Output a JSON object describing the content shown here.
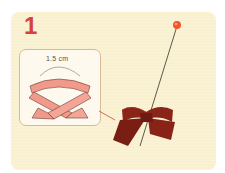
{
  "step": {
    "number": "1"
  },
  "diagram": {
    "measurement_label": "1.5 cm",
    "ribbon_color": "#f19a8a",
    "ribbon_outline": "#6b3b35"
  },
  "photo": {
    "description": "dark red satin ribbon bow held with a straight pin",
    "bow_color": "#8b2418",
    "pin_head_color": "#f2552b"
  },
  "colors": {
    "card_background": "#f9f0cf",
    "step_number": "#d6423a",
    "inset_background": "#fdf9ef",
    "inset_border": "#d9b99a"
  }
}
